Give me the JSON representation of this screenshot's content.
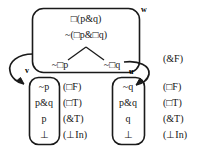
{
  "diagram": {
    "type": "modal-tableau",
    "line_color": "#1a1a1a",
    "text_color": "#141414",
    "background": "#ffffff",
    "worlds": [
      {
        "id": "w",
        "label": "w",
        "formulas": [
          {
            "text": "□(p&q)"
          },
          {
            "text": "~(□p&□q)"
          }
        ],
        "branches": [
          {
            "text": "~□p"
          },
          {
            "text": "~□q"
          }
        ],
        "branch_rule": "(&F)"
      },
      {
        "id": "v",
        "label": "v",
        "lines": [
          {
            "formula": "~p",
            "rule": "(□F)"
          },
          {
            "formula": "p&q",
            "rule": "(□T)"
          },
          {
            "formula": "p",
            "rule": "(&T)"
          },
          {
            "formula": "⊥",
            "rule": "(⊥In)"
          }
        ]
      },
      {
        "id": "u",
        "label": "u",
        "lines": [
          {
            "formula": "~q",
            "rule": "(□F)"
          },
          {
            "formula": "p&q",
            "rule": "(□T)"
          },
          {
            "formula": "q",
            "rule": "(&T)"
          },
          {
            "formula": "⊥",
            "rule": "(⊥In)"
          }
        ]
      }
    ]
  }
}
